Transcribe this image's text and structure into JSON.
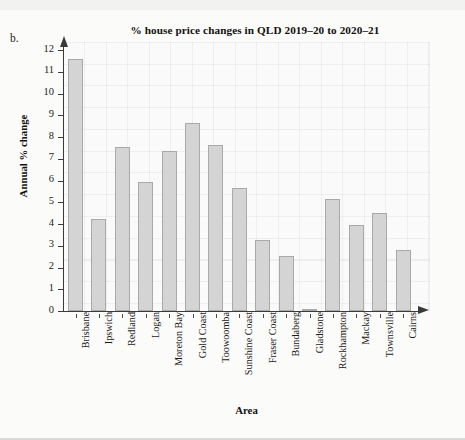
{
  "figure_label": "b.",
  "chart_data": {
    "type": "bar",
    "title": "% house price changes in QLD 2019–20 to 2020–21",
    "xlabel": "Area",
    "ylabel": "Annual % change",
    "ylim": [
      0,
      12
    ],
    "ytick_labels": [
      "0",
      "1",
      "2",
      "3",
      "4",
      "5",
      "6",
      "7",
      "8",
      "9",
      "10",
      "11",
      "12"
    ],
    "yticks": [
      0,
      1,
      2,
      3,
      4,
      5,
      6,
      7,
      8,
      9,
      10,
      11,
      12
    ],
    "grid": true,
    "legend": "none",
    "categories": [
      "Brisbane",
      "Ipswich",
      "Redland",
      "Logan",
      "Moreton Bay",
      "Gold Coast",
      "Toowoomba",
      "Sunshine Coast",
      "Fraser Coast",
      "Bundaberg",
      "Gladstone",
      "Rockhampton",
      "Mackay",
      "Townsville",
      "Cairns"
    ],
    "values": [
      11.6,
      4.25,
      7.55,
      5.95,
      7.35,
      8.65,
      7.65,
      5.65,
      3.25,
      2.55,
      0.05,
      5.15,
      3.95,
      4.5,
      2.8
    ],
    "bar_color": "#d4d4d4",
    "bar_edge_color": "#a9a9a9"
  }
}
